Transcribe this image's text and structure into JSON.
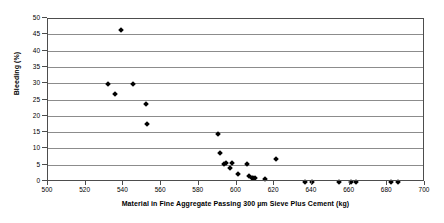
{
  "chart_data": {
    "type": "scatter",
    "title": "",
    "xlabel": "Material in Fine Aggregate Passing 300 µm Sieve Plus Cement (kg)",
    "ylabel": "Bleeding (%)",
    "xlim": [
      500,
      700
    ],
    "ylim": [
      0,
      50
    ],
    "xticks": [
      500,
      520,
      540,
      560,
      580,
      600,
      620,
      640,
      660,
      680,
      700
    ],
    "yticks": [
      0,
      5,
      10,
      15,
      20,
      25,
      30,
      35,
      40,
      45,
      50
    ],
    "grid": "horizontal",
    "legend": "none",
    "marker": "filled-diamond",
    "marker_color": "#000000",
    "series": [
      {
        "name": "Bleeding vs material passing 300 micron sieve plus cement",
        "points": [
          [
            532.0,
            30.0
          ],
          [
            535.5,
            27.0
          ],
          [
            538.5,
            46.5
          ],
          [
            545.0,
            30.0
          ],
          [
            552.0,
            24.0
          ],
          [
            552.5,
            17.7
          ],
          [
            590.0,
            14.6
          ],
          [
            591.5,
            8.8
          ],
          [
            594.5,
            5.7
          ],
          [
            597.5,
            5.7
          ],
          [
            593.5,
            5.4
          ],
          [
            596.5,
            4.3
          ],
          [
            601.0,
            2.6
          ],
          [
            605.5,
            5.5
          ],
          [
            606.5,
            1.7
          ],
          [
            608.0,
            1.3
          ],
          [
            609.0,
            1.2
          ],
          [
            610.0,
            1.1
          ],
          [
            615.0,
            0.9
          ],
          [
            621.0,
            7.0
          ],
          [
            636.5,
            0.0
          ],
          [
            640.0,
            0.0
          ],
          [
            654.5,
            0.0
          ],
          [
            661.0,
            0.0
          ],
          [
            663.5,
            0.0
          ],
          [
            682.0,
            0.0
          ],
          [
            685.5,
            0.0
          ]
        ]
      }
    ]
  },
  "axis": {
    "y_tick_labels": [
      "0",
      "5",
      "10",
      "15",
      "20",
      "25",
      "30",
      "35",
      "40",
      "45",
      "50"
    ],
    "x_tick_labels": [
      "500",
      "520",
      "540",
      "560",
      "580",
      "600",
      "620",
      "640",
      "660",
      "680",
      "700"
    ]
  }
}
